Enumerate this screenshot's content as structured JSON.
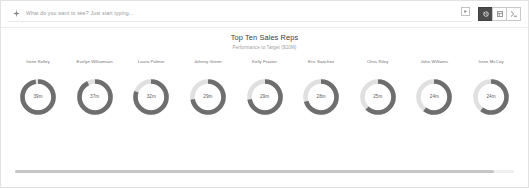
{
  "search": {
    "placeholder": "What do you want to see? Just start typing...",
    "icon": "sparkle-icon",
    "submit_icon": "play-icon"
  },
  "toolbar": {
    "buttons": [
      {
        "name": "history-button",
        "icon": "clock-rewind-icon",
        "active": true
      },
      {
        "name": "table-view-button",
        "icon": "grid-icon",
        "active": false
      },
      {
        "name": "console-button",
        "icon": "terminal-icon",
        "active": false
      }
    ]
  },
  "chart_data": {
    "type": "pie",
    "title": "Top Ten Sales Reps",
    "subtitle": "Performance to Target ($10M)",
    "unit": "m",
    "target": 40,
    "track_color": "#e0e0e0",
    "fill_color": "#6e6e6e",
    "categories": [
      "Irene Kelley",
      "Evelyn Williamson",
      "Laura Palmer",
      "Johnny Green",
      "Kelly Frazier",
      "Eric Sanchez",
      "Chris Riley",
      "John Williams",
      "Irene McCoy"
    ],
    "values": [
      39,
      37,
      32,
      29,
      29,
      28,
      25,
      24,
      24
    ],
    "labels": [
      "39m",
      "37m",
      "32m",
      "29m",
      "29m",
      "28m",
      "25m",
      "24m",
      "24m"
    ],
    "percents": [
      97,
      92,
      80,
      72,
      72,
      70,
      62,
      60,
      60
    ],
    "xlabel": "",
    "ylabel": "",
    "legend": "none",
    "grid": false
  },
  "scrollbar": {
    "name": "horizontal-scrollbar",
    "position": 0
  }
}
